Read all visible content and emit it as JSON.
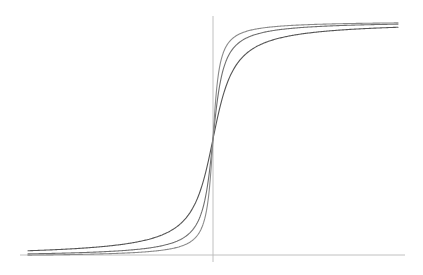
{
  "chart_data": {
    "type": "line",
    "title": "",
    "xlabel": "",
    "ylabel": "",
    "grid": false,
    "legend": null,
    "xlim": [
      -10,
      10
    ],
    "ylim": [
      -1.05,
      1.05
    ],
    "axes": {
      "x_axis": {
        "x_from": -10,
        "x_to": 10,
        "y": -1.05
      },
      "y_axis": {
        "x": 0,
        "y_from": -1.05,
        "y_to": 1.05
      }
    },
    "series": [
      {
        "name": "curve-1 (gentlest)",
        "function": "2/pi*atan(x*k)",
        "k": 1.2,
        "color": "#555555"
      },
      {
        "name": "curve-2 (medium)",
        "function": "2/pi*atan(x*k)",
        "k": 2.4,
        "color": "#707070"
      },
      {
        "name": "curve-3 (steepest)",
        "function": "2/pi*atan(x*k)",
        "k": 4.0,
        "color": "#8a8a8a"
      }
    ],
    "sample_points": {
      "x": [
        -10,
        -5,
        -2,
        -1,
        -0.5,
        0,
        0.5,
        1,
        2,
        5,
        10
      ],
      "curve-1": [
        -0.95,
        -0.9,
        -0.75,
        -0.56,
        -0.35,
        0,
        0.35,
        0.56,
        0.75,
        0.9,
        0.95
      ],
      "curve-2": [
        -0.97,
        -0.95,
        -0.87,
        -0.74,
        -0.56,
        0,
        0.56,
        0.74,
        0.87,
        0.95,
        0.97
      ],
      "curve-3": [
        -0.98,
        -0.97,
        -0.92,
        -0.84,
        -0.7,
        0,
        0.7,
        0.84,
        0.92,
        0.97,
        0.98
      ]
    }
  },
  "plot_area": {
    "left": 27,
    "right": 398,
    "center_x": 213,
    "center_y": 139,
    "half_height": 118,
    "x_axis_pixel_y": 255,
    "x_axis_pixel_from": 20,
    "x_axis_pixel_to": 405,
    "y_axis_pixel_from": 16,
    "y_axis_pixel_to": 262
  }
}
